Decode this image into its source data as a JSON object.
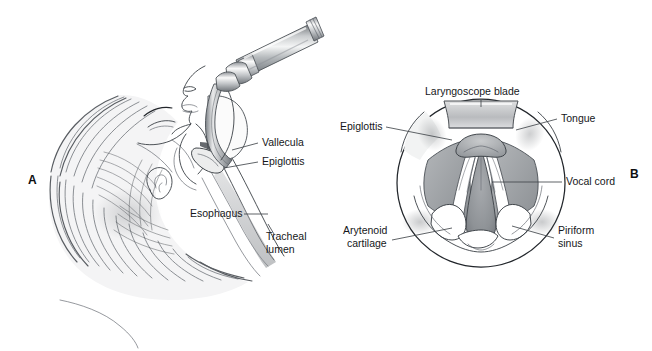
{
  "figure": {
    "background_color": "#ffffff",
    "ink_color": "#3a3f45",
    "label_color": "#15171a",
    "leader_color": "#43484d",
    "tissue_fill": "#9a9da1",
    "metal_light": "#f2f2f3",
    "metal_mid": "#9b9ea2",
    "metal_dark": "#5d6165"
  },
  "panel_a": {
    "letter": "A",
    "labels": [
      {
        "text": "Vallecula",
        "x": 262,
        "y": 146
      },
      {
        "text": "Epiglottis",
        "x": 262,
        "y": 165
      },
      {
        "text": "Esophagus",
        "x": 190,
        "y": 217
      },
      {
        "text": "Tracheal",
        "x": 266,
        "y": 240
      },
      {
        "text": "lumen",
        "x": 266,
        "y": 253
      }
    ]
  },
  "panel_b": {
    "letter": "B",
    "labels": [
      {
        "text": "Laryngoscope blade",
        "x": 425,
        "y": 95
      },
      {
        "text": "Tongue",
        "x": 561,
        "y": 122
      },
      {
        "text": "Epiglottis",
        "x": 340,
        "y": 130
      },
      {
        "text": "Vocal cord",
        "x": 566,
        "y": 185
      },
      {
        "text": "Arytenoid",
        "x": 343,
        "y": 234
      },
      {
        "text": "cartilage",
        "x": 347,
        "y": 247
      },
      {
        "text": "Piriform",
        "x": 558,
        "y": 234
      },
      {
        "text": "sinus",
        "x": 558,
        "y": 247
      }
    ]
  }
}
